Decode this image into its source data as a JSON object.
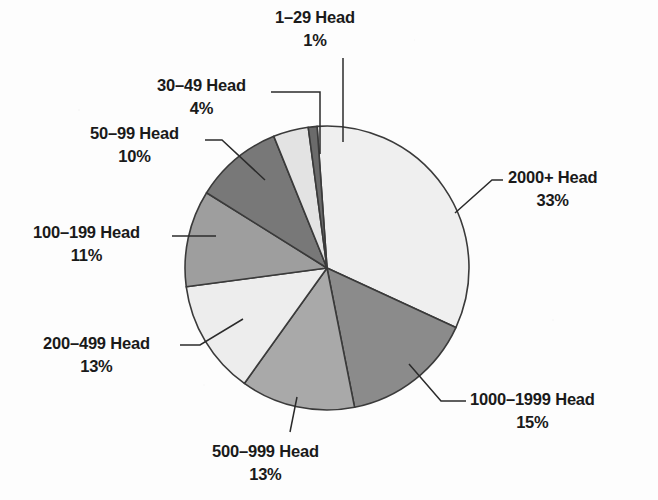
{
  "chart_data": {
    "type": "pie",
    "title": "",
    "subtitle": "",
    "xlabel": "",
    "ylabel": "",
    "grid": false,
    "legend_position": "callout-labels",
    "units": "percent",
    "center": {
      "x": 327,
      "y": 268
    },
    "radius": 142,
    "start_angle_deg": -4,
    "categories": [
      "2000+ Head",
      "1000–1999 Head",
      "500–999 Head",
      "200–499 Head",
      "100–199 Head",
      "50–99 Head",
      "30–49 Head",
      "1–29 Head"
    ],
    "values": [
      33,
      15,
      13,
      13,
      11,
      10,
      4,
      1
    ],
    "slices": [
      {
        "label": "2000+ Head",
        "percent": 33,
        "value_text": "33%",
        "color": "#efefef",
        "label_x": 508,
        "label_y": 166,
        "align": "left",
        "leader": [
          [
            455,
            213
          ],
          [
            492,
            180
          ],
          [
            503,
            180
          ]
        ]
      },
      {
        "label": "1000–1999 Head",
        "percent": 15,
        "value_text": "15%",
        "color": "#8b8b8b",
        "label_x": 470,
        "label_y": 388,
        "align": "left",
        "leader": [
          [
            409,
            364
          ],
          [
            441,
            401
          ],
          [
            466,
            401
          ]
        ]
      },
      {
        "label": "500–999 Head",
        "percent": 13,
        "value_text": "13%",
        "color": "#a9a9a9",
        "label_x": 212,
        "label_y": 440,
        "align": "left",
        "leader": [
          [
            297,
            397
          ],
          [
            290,
            432
          ]
        ]
      },
      {
        "label": "200–499 Head",
        "percent": 13,
        "value_text": "13%",
        "color": "#ededed",
        "label_x": 43,
        "label_y": 332,
        "align": "left",
        "leader": [
          [
            243,
            319
          ],
          [
            200,
            345
          ],
          [
            180,
            345
          ]
        ]
      },
      {
        "label": "100–199 Head",
        "percent": 11,
        "value_text": "11%",
        "color": "#9e9e9e",
        "label_x": 33,
        "label_y": 221,
        "align": "left",
        "leader": [
          [
            216,
            236
          ],
          [
            172,
            236
          ]
        ]
      },
      {
        "label": "50–99 Head",
        "percent": 10,
        "value_text": "10%",
        "color": "#787878",
        "label_x": 90,
        "label_y": 122,
        "align": "left",
        "leader": [
          [
            265,
            180
          ],
          [
            222,
            140
          ],
          [
            205,
            140
          ]
        ]
      },
      {
        "label": "30–49 Head",
        "percent": 4,
        "value_text": "4%",
        "color": "#e3e3e3",
        "label_x": 157,
        "label_y": 74,
        "align": "left",
        "leader": [
          [
            320,
            154
          ],
          [
            320,
            92
          ],
          [
            271,
            92
          ]
        ]
      },
      {
        "label": "1–29 Head",
        "percent": 1,
        "value_text": "1%",
        "color": "#6b6b6b",
        "label_x": 275,
        "label_y": 6,
        "align": "left",
        "leader": [
          [
            343,
            142
          ],
          [
            343,
            58
          ]
        ]
      }
    ],
    "stroke_color": "#3a3a3a",
    "stroke_width": 1.6,
    "background": "#fdfdfd"
  }
}
